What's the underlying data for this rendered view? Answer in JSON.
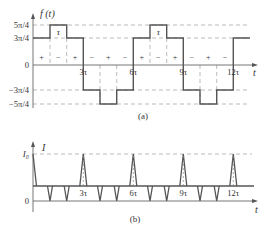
{
  "figure_a": {
    "ylabel": "f (t)",
    "xlabel": "t",
    "caption": "(a)",
    "y_ticks": [
      "5π/4",
      "3π/4",
      "0",
      "−3π/4",
      "−5π/4"
    ],
    "x_ticks": [
      "3τ",
      "6τ",
      "9τ",
      "12τ"
    ],
    "tau_label": "τ",
    "signs": [
      "+",
      "−",
      "+",
      "−",
      "+",
      "−",
      "+",
      "−",
      "+",
      "−",
      "+",
      "−"
    ]
  },
  "figure_b": {
    "ylabel": "I",
    "xlabel": "t",
    "caption": "(b)",
    "y_ticks": [
      "I₀",
      "0"
    ],
    "x_ticks": [
      "3τ",
      "6τ",
      "9τ",
      "12τ"
    ]
  },
  "colors": {
    "line": "#555555",
    "dash": "#999999",
    "text": "#333333"
  }
}
